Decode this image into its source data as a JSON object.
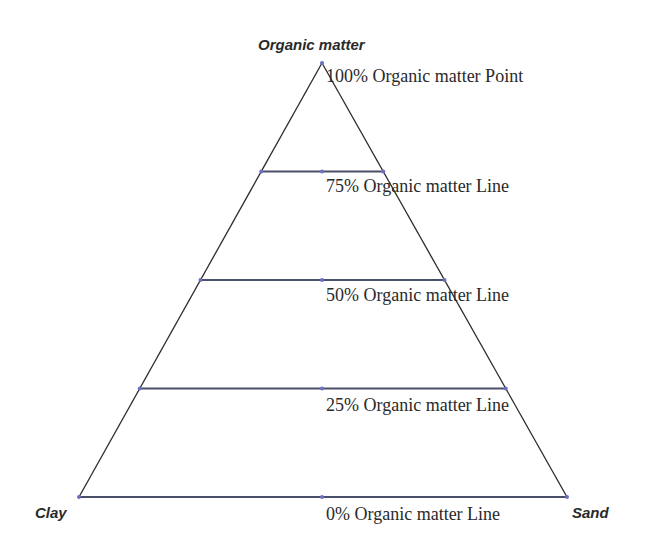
{
  "diagram": {
    "type": "ternary-triangle",
    "vertices": {
      "top": {
        "label": "Organic matter",
        "x": 322,
        "y": 63
      },
      "bottom_left": {
        "label": "Clay",
        "x": 79,
        "y": 497
      },
      "bottom_right": {
        "label": "Sand",
        "x": 567,
        "y": 497
      }
    },
    "levels": [
      {
        "percent": 100,
        "label": "100% Organic matter Point",
        "kind": "point"
      },
      {
        "percent": 75,
        "label": "75% Organic matter Line",
        "kind": "line"
      },
      {
        "percent": 50,
        "label": "50% Organic matter Line",
        "kind": "line"
      },
      {
        "percent": 25,
        "label": "25% Organic matter Line",
        "kind": "line"
      },
      {
        "percent": 0,
        "label": "0% Organic matter Line",
        "kind": "line"
      }
    ],
    "colors": {
      "outline": "#2b2b2b",
      "level_line": "#4a4f6a",
      "marker": "#6b6fc0",
      "text": "#2a2a2a"
    }
  }
}
